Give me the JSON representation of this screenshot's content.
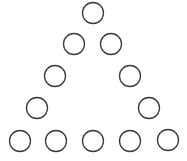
{
  "diagram": {
    "stroke_color": "#3a3a3a",
    "fill_color": "#ffffff",
    "radius": 10.5,
    "circles": [
      {
        "row": 1,
        "cx": 93,
        "cy": 13
      },
      {
        "row": 2,
        "cx": 74,
        "cy": 44
      },
      {
        "row": 2,
        "cx": 111,
        "cy": 44
      },
      {
        "row": 3,
        "cx": 55,
        "cy": 76
      },
      {
        "row": 3,
        "cx": 130,
        "cy": 76
      },
      {
        "row": 4,
        "cx": 37,
        "cy": 108
      },
      {
        "row": 4,
        "cx": 149,
        "cy": 108
      },
      {
        "row": 5,
        "cx": 20,
        "cy": 141
      },
      {
        "row": 5,
        "cx": 56,
        "cy": 141
      },
      {
        "row": 5,
        "cx": 93,
        "cy": 141
      },
      {
        "row": 5,
        "cx": 130,
        "cy": 141
      },
      {
        "row": 5,
        "cx": 168,
        "cy": 140
      }
    ]
  }
}
